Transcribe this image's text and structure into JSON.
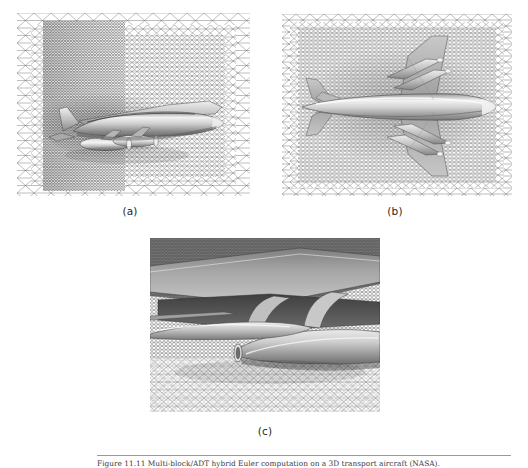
{
  "page": {
    "background": "#ffffff",
    "width": 528,
    "height": 468
  },
  "figure": {
    "subfigures": [
      {
        "id": "a",
        "label": "(a)",
        "view": "side-view",
        "description": "Side view of a twin-engine transport aircraft immersed in an unstructured triangular surface mesh, with a refined high-density mesh band across the forward half of the domain."
      },
      {
        "id": "b",
        "label": "(b)",
        "view": "top-view",
        "description": "Planform (top) view of the aircraft showing swept wings, four underwing engine nacelles and the horizontal/vertical tail, surrounded by a fine unstructured triangular mesh."
      },
      {
        "id": "c",
        "label": "(c)",
        "view": "close-up-nacelles",
        "description": "Close-up detail of the engine nacelles and pylons beneath the wing, showing the boundary-layer mesh clustering near the solid surfaces."
      }
    ]
  },
  "caption": {
    "rule_color": "#9a9a9a",
    "text": "Figure 11.11   Multi-block/ADT hybrid Euler computation on a 3D transport aircraft (NASA)."
  },
  "colors": {
    "mesh_line": "#4a4a4a",
    "surface_light": "#d8d8d8",
    "surface_mid": "#a8a8a8",
    "surface_dark": "#6f6f6f",
    "text": "#1f1f1f"
  }
}
